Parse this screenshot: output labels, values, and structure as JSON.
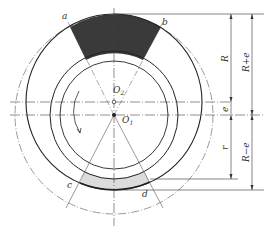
{
  "diagram": {
    "type": "eccentric rotor geometry",
    "points": {
      "a": "a",
      "b": "b",
      "c": "c",
      "d": "d",
      "O1": "O",
      "O1_sub": "1",
      "O2": "O",
      "O2_sub": "2"
    },
    "dimensions": {
      "R": "R",
      "R_plus_e": "R+e",
      "e": "e",
      "r": "r",
      "R_minus_e": "R−e"
    },
    "colors": {
      "line": "#222222",
      "dark_sector": "#3a3a3a",
      "light_sector": "#dcdcdc"
    }
  }
}
